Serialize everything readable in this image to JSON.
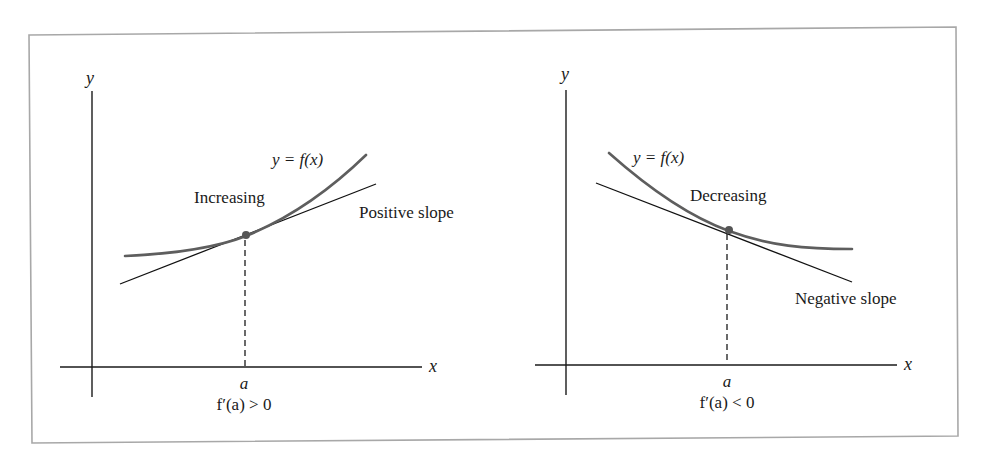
{
  "figure": {
    "left_panel": {
      "y_axis_label": "y",
      "x_axis_label": "x",
      "curve_label": "y = f(x)",
      "region_label": "Increasing",
      "tangent_label": "Positive slope",
      "point_label": "a",
      "derivative_condition": "f′(a) > 0"
    },
    "right_panel": {
      "y_axis_label": "y",
      "x_axis_label": "x",
      "curve_label": "y = f(x)",
      "region_label": "Decreasing",
      "tangent_label": "Negative slope",
      "point_label": "a",
      "derivative_condition": "f′(a) < 0"
    },
    "colors": {
      "curve": "#5e5e5e",
      "tangent": "#111111",
      "frame": "#a8a8a8",
      "point": "#555555"
    }
  }
}
